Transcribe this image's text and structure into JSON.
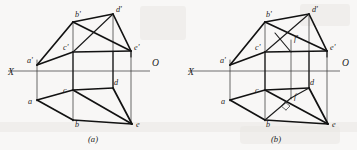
{
  "figure": {
    "background_color": "#f8f7f6",
    "line_color": "#121212",
    "axis_color": "#555555",
    "width": 357,
    "height": 150
  },
  "captions": {
    "left": "(a)",
    "right": "(b)"
  },
  "axis": {
    "x_label": "X",
    "o_label": "O"
  },
  "diagrams": [
    {
      "id": "a",
      "caption": "(a)",
      "axis": {
        "x_label": "X",
        "o_label": "O",
        "y": 71,
        "x_start": 8,
        "x_end": 150
      },
      "points": [
        {
          "name": "a_prime",
          "label": "a'",
          "x": 37,
          "y": 65,
          "label_x": 27,
          "label_y": 63
        },
        {
          "name": "b_prime",
          "label": "b'",
          "x": 73,
          "y": 22,
          "label_x": 75,
          "label_y": 17
        },
        {
          "name": "c_prime",
          "label": "c'",
          "x": 73,
          "y": 52,
          "label_x": 63,
          "label_y": 50
        },
        {
          "name": "d_prime",
          "label": "d'",
          "x": 113,
          "y": 14,
          "label_x": 116,
          "label_y": 12
        },
        {
          "name": "e_prime",
          "label": "e'",
          "x": 131,
          "y": 51,
          "label_x": 134,
          "label_y": 50
        },
        {
          "name": "a",
          "label": "a",
          "x": 37,
          "y": 100,
          "label_x": 28,
          "label_y": 104
        },
        {
          "name": "b",
          "label": "b",
          "x": 73,
          "y": 120,
          "label_x": 75,
          "label_y": 127
        },
        {
          "name": "c",
          "label": "c",
          "x": 73,
          "y": 90,
          "label_x": 63,
          "label_y": 92
        },
        {
          "name": "d",
          "label": "d",
          "x": 113,
          "y": 88,
          "label_x": 114,
          "label_y": 85
        },
        {
          "name": "e",
          "label": "e",
          "x": 132,
          "y": 124,
          "label_x": 136,
          "label_y": 127
        }
      ]
    },
    {
      "id": "b",
      "caption": "(b)",
      "axis": {
        "x_label": "X",
        "o_label": "O",
        "y": 71,
        "x_start": 188,
        "x_end": 340
      },
      "points": [
        {
          "name": "a_prime",
          "label": "a'",
          "x": 230,
          "y": 65,
          "label_x": 220,
          "label_y": 63
        },
        {
          "name": "b_prime",
          "label": "b'",
          "x": 265,
          "y": 22,
          "label_x": 266,
          "label_y": 17
        },
        {
          "name": "c_prime",
          "label": "c'",
          "x": 265,
          "y": 52,
          "label_x": 255,
          "label_y": 50
        },
        {
          "name": "d_prime",
          "label": "d'",
          "x": 309,
          "y": 14,
          "label_x": 312,
          "label_y": 12
        },
        {
          "name": "e_prime",
          "label": "e'",
          "x": 327,
          "y": 51,
          "label_x": 330,
          "label_y": 50
        },
        {
          "name": "f_prime",
          "label": "f'",
          "x": 291,
          "y": 40,
          "label_x": 294,
          "label_y": 39
        },
        {
          "name": "a",
          "label": "a",
          "x": 230,
          "y": 100,
          "label_x": 221,
          "label_y": 104
        },
        {
          "name": "b",
          "label": "b",
          "x": 265,
          "y": 120,
          "label_x": 266,
          "label_y": 127
        },
        {
          "name": "c",
          "label": "c",
          "x": 265,
          "y": 90,
          "label_x": 255,
          "label_y": 92
        },
        {
          "name": "d",
          "label": "d",
          "x": 309,
          "y": 88,
          "label_x": 310,
          "label_y": 85
        },
        {
          "name": "e",
          "label": "e",
          "x": 328,
          "y": 124,
          "label_x": 332,
          "label_y": 127
        },
        {
          "name": "f",
          "label": "f",
          "x": 291,
          "y": 98,
          "label_x": 294,
          "label_y": 97
        }
      ],
      "right_angle_marker": {
        "x": 288,
        "y": 105,
        "size": 5
      }
    }
  ]
}
